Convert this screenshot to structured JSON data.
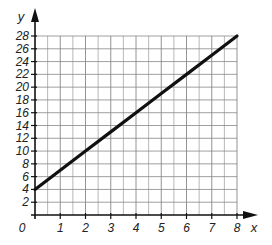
{
  "chart_data": {
    "type": "line",
    "title": "",
    "xlabel": "x",
    "ylabel": "y",
    "xlim": [
      0,
      8
    ],
    "ylim": [
      0,
      28
    ],
    "x_ticks": [
      "1",
      "2",
      "3",
      "4",
      "5",
      "6",
      "7",
      "8"
    ],
    "y_ticks": [
      "2",
      "4",
      "6",
      "8",
      "10",
      "12",
      "14",
      "16",
      "18",
      "20",
      "22",
      "24",
      "26",
      "28"
    ],
    "origin_label": "0",
    "grid": true,
    "grid_minor": {
      "x_step": 0.5,
      "y_step": 2
    },
    "legend": null,
    "series": [
      {
        "name": "line",
        "x": [
          0,
          1,
          2,
          3,
          4,
          5,
          6,
          7,
          8
        ],
        "y": [
          4,
          7,
          10,
          13,
          16,
          19,
          22,
          25,
          28
        ],
        "equation": "y = 3x + 4"
      }
    ]
  },
  "colors": {
    "line": "#111111",
    "grid": "#888888",
    "axis": "#111111"
  }
}
